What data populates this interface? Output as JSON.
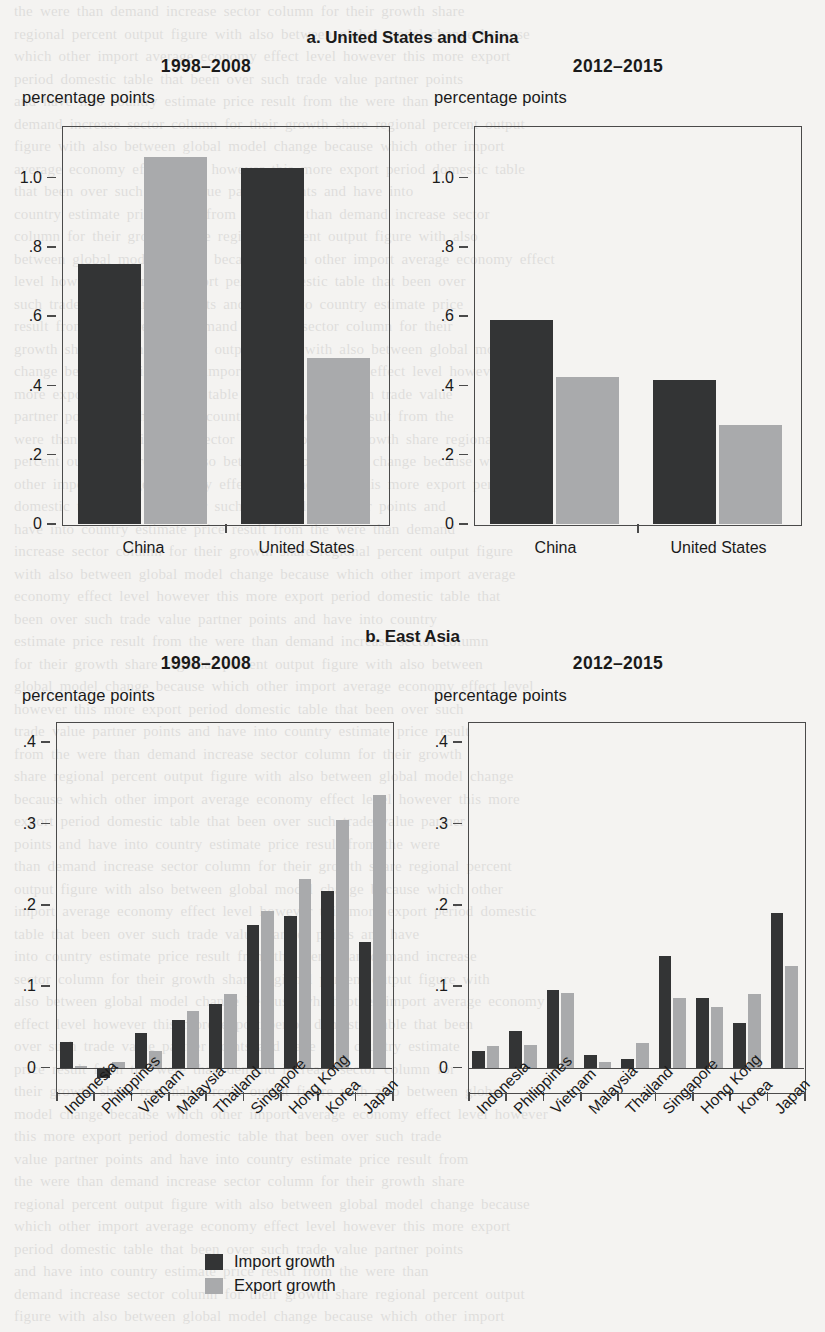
{
  "figure": {
    "panel_a_title": "a. United States and China",
    "panel_b_title": "b. East Asia",
    "period_1": "1998–2008",
    "period_2": "2012–2015",
    "units": "percentage points",
    "legend": [
      {
        "label": "Import growth",
        "color": "#333435",
        "key": "import"
      },
      {
        "label": "Export growth",
        "color": "#a9aaac",
        "key": "export"
      }
    ]
  },
  "chart_data": [
    {
      "id": "panel-a-1998-2008",
      "type": "bar",
      "title": "1998–2008",
      "panel": "a. United States and China",
      "xlabel": "",
      "ylabel": "percentage points",
      "ylim": [
        0,
        1.15
      ],
      "yticks": [
        "0",
        ".2",
        ".4",
        ".6",
        ".8",
        "1.0"
      ],
      "ytick_values": [
        0,
        0.2,
        0.4,
        0.6,
        0.8,
        1.0
      ],
      "grid": false,
      "legend_position": "below figure",
      "categories": [
        "China",
        "United States"
      ],
      "series": [
        {
          "name": "Import growth",
          "color": "#333435",
          "values": [
            0.75,
            1.03
          ]
        },
        {
          "name": "Export growth",
          "color": "#a9aaac",
          "values": [
            1.06,
            0.48
          ]
        }
      ]
    },
    {
      "id": "panel-a-2012-2015",
      "type": "bar",
      "title": "2012–2015",
      "panel": "a. United States and China",
      "xlabel": "",
      "ylabel": "percentage points",
      "ylim": [
        0,
        1.15
      ],
      "yticks": [
        "0",
        ".2",
        ".4",
        ".6",
        ".8",
        "1.0"
      ],
      "ytick_values": [
        0,
        0.2,
        0.4,
        0.6,
        0.8,
        1.0
      ],
      "grid": false,
      "legend_position": "below figure",
      "categories": [
        "China",
        "United States"
      ],
      "series": [
        {
          "name": "Import growth",
          "color": "#333435",
          "values": [
            0.59,
            0.415
          ]
        },
        {
          "name": "Export growth",
          "color": "#a9aaac",
          "values": [
            0.425,
            0.285
          ]
        }
      ]
    },
    {
      "id": "panel-b-1998-2008",
      "type": "bar",
      "title": "1998–2008",
      "panel": "b. East Asia",
      "xlabel": "",
      "ylabel": "percentage points",
      "ylim": [
        -0.03,
        0.425
      ],
      "yticks": [
        "0",
        ".1",
        ".2",
        ".3",
        ".4"
      ],
      "ytick_values": [
        0,
        0.1,
        0.2,
        0.3,
        0.4
      ],
      "grid": false,
      "legend_position": "below figure",
      "categories": [
        "Indonesia",
        "Philippines",
        "Vietnam",
        "Malaysia",
        "Thailand",
        "Singapore",
        "Hong Kong",
        "Korea",
        "Japan"
      ],
      "series": [
        {
          "name": "Import growth",
          "color": "#333435",
          "values": [
            0.032,
            -0.013,
            0.042,
            0.058,
            0.078,
            0.175,
            0.187,
            0.217,
            0.155
          ]
        },
        {
          "name": "Export growth",
          "color": "#a9aaac",
          "values": [
            0.002,
            0.007,
            0.021,
            0.07,
            0.09,
            0.193,
            0.232,
            0.305,
            0.335
          ]
        }
      ]
    },
    {
      "id": "panel-b-2012-2015",
      "type": "bar",
      "title": "2012–2015",
      "panel": "b. East Asia",
      "xlabel": "",
      "ylabel": "percentage points",
      "ylim": [
        -0.03,
        0.425
      ],
      "yticks": [
        "0",
        ".1",
        ".2",
        ".3",
        ".4"
      ],
      "ytick_values": [
        0,
        0.1,
        0.2,
        0.3,
        0.4
      ],
      "grid": false,
      "legend_position": "below figure",
      "categories": [
        "Indonesia",
        "Philippines",
        "Vietnam",
        "Malaysia",
        "Thailand",
        "Singapore",
        "Hong Kong",
        "Korea",
        "Japan"
      ],
      "series": [
        {
          "name": "Import growth",
          "color": "#333435",
          "values": [
            0.021,
            0.045,
            0.096,
            0.016,
            0.01,
            0.137,
            0.086,
            0.055,
            0.19
          ]
        },
        {
          "name": "Export growth",
          "color": "#a9aaac",
          "values": [
            0.026,
            0.028,
            0.092,
            0.007,
            0.03,
            0.085,
            0.075,
            0.09,
            0.125
          ]
        }
      ]
    }
  ]
}
